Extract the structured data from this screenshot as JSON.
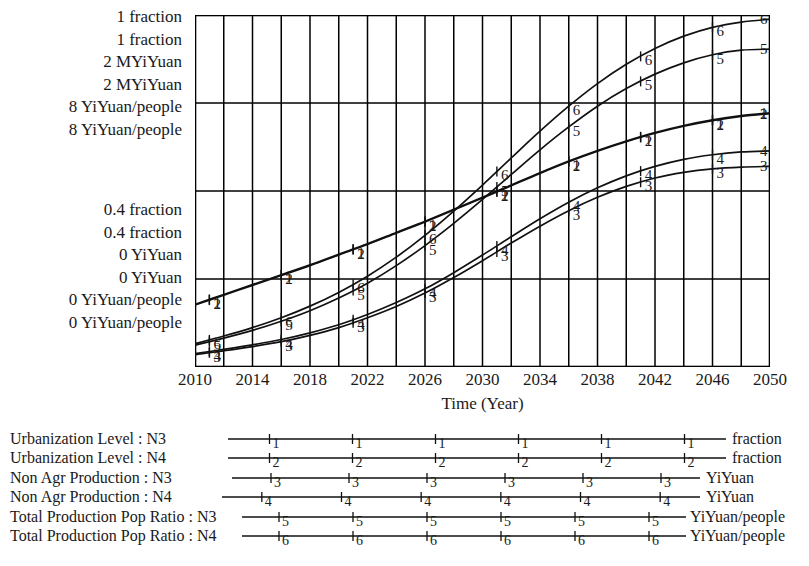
{
  "chart_data": {
    "type": "line",
    "title": "",
    "xlabel": "Time (Year)",
    "ylabel": "",
    "grid": true,
    "legend_position": "bottom",
    "x": [
      2010,
      2012,
      2014,
      2016,
      2018,
      2020,
      2022,
      2024,
      2026,
      2028,
      2030,
      2032,
      2034,
      2036,
      2038,
      2040,
      2042,
      2044,
      2046,
      2048,
      2050
    ],
    "xlim": [
      2010,
      2050
    ],
    "x_tick_labels": [
      "2010",
      "2014",
      "2018",
      "2022",
      "2026",
      "2030",
      "2034",
      "2038",
      "2042",
      "2046",
      "2050"
    ],
    "x_major_step": 4,
    "x_minor_step": 2,
    "axis_scales": [
      {
        "id": "scale-1",
        "marker": "1",
        "top_label": "1 fraction",
        "bottom_label": "0.4 fraction",
        "unit": "fraction",
        "max": "1",
        "min": "0.4"
      },
      {
        "id": "scale-2",
        "marker": "2",
        "top_label": "1 fraction",
        "bottom_label": "0.4 fraction",
        "unit": "fraction",
        "max": "1",
        "min": "0.4"
      },
      {
        "id": "scale-3",
        "marker": "3",
        "top_label": "2 MYiYuan",
        "bottom_label": "0 YiYuan",
        "unit": "YiYuan",
        "max": "2",
        "min": "0"
      },
      {
        "id": "scale-4",
        "marker": "4",
        "top_label": "2 MYiYuan",
        "bottom_label": "0 YiYuan",
        "unit": "YiYuan",
        "max": "2",
        "min": "0"
      },
      {
        "id": "scale-5",
        "marker": "5",
        "top_label": "8 YiYuan/people",
        "bottom_label": "0 YiYuan/people",
        "unit": "YiYuan/people",
        "max": "8",
        "min": "0"
      },
      {
        "id": "scale-6",
        "marker": "6",
        "top_label": "8 YiYuan/people",
        "bottom_label": "0 YiYuan/people",
        "unit": "YiYuan/people",
        "max": "8",
        "min": "0"
      }
    ],
    "y_gridlines_fraction": [
      1.0,
      0.75,
      0.5,
      0.25,
      0.0
    ],
    "series": [
      {
        "name": "Urbanization Level : N3",
        "marker": "1",
        "unit": "fraction",
        "values": [
          0.178,
          0.206,
          0.234,
          0.262,
          0.29,
          0.32,
          0.35,
          0.382,
          0.414,
          0.448,
          0.482,
          0.517,
          0.552,
          0.585,
          0.615,
          0.642,
          0.666,
          0.686,
          0.702,
          0.714,
          0.722
        ]
      },
      {
        "name": "Urbanization Level : N4",
        "marker": "2",
        "unit": "fraction",
        "values": [
          0.176,
          0.204,
          0.232,
          0.26,
          0.288,
          0.318,
          0.348,
          0.38,
          0.412,
          0.446,
          0.48,
          0.515,
          0.55,
          0.583,
          0.613,
          0.64,
          0.664,
          0.684,
          0.7,
          0.712,
          0.72
        ]
      },
      {
        "name": "Non Agr Production : N3",
        "marker": "3",
        "unit": "YiYuan",
        "values": [
          0.035,
          0.046,
          0.058,
          0.072,
          0.09,
          0.112,
          0.14,
          0.172,
          0.21,
          0.254,
          0.302,
          0.352,
          0.4,
          0.444,
          0.482,
          0.513,
          0.537,
          0.553,
          0.563,
          0.568,
          0.57
        ]
      },
      {
        "name": "Non Agr Production : N4",
        "marker": "4",
        "unit": "YiYuan",
        "values": [
          0.038,
          0.05,
          0.063,
          0.078,
          0.097,
          0.12,
          0.149,
          0.183,
          0.222,
          0.268,
          0.318,
          0.37,
          0.421,
          0.468,
          0.509,
          0.543,
          0.57,
          0.59,
          0.603,
          0.611,
          0.614
        ]
      },
      {
        "name": "Total Production Pop Ratio : N3",
        "marker": "5",
        "unit": "YiYuan/people",
        "values": [
          0.062,
          0.082,
          0.104,
          0.13,
          0.16,
          0.196,
          0.238,
          0.288,
          0.345,
          0.408,
          0.476,
          0.547,
          0.617,
          0.682,
          0.741,
          0.791,
          0.832,
          0.864,
          0.887,
          0.9,
          0.903
        ]
      },
      {
        "name": "Total Production Pop Ratio : N4",
        "marker": "6",
        "unit": "YiYuan/people",
        "values": [
          0.066,
          0.088,
          0.112,
          0.14,
          0.173,
          0.212,
          0.258,
          0.312,
          0.374,
          0.443,
          0.517,
          0.594,
          0.67,
          0.741,
          0.805,
          0.86,
          0.905,
          0.94,
          0.965,
          0.98,
          0.988
        ]
      }
    ],
    "marker_x_positions": [
      2011,
      2016,
      2021,
      2026,
      2031,
      2036,
      2041,
      2046
    ]
  },
  "legend": {
    "rows": [
      {
        "label": "Urbanization Level : N3",
        "marker": "1",
        "unit": "fraction"
      },
      {
        "label": "Urbanization Level : N4",
        "marker": "2",
        "unit": "fraction"
      },
      {
        "label": "Non Agr Production : N3",
        "marker": "3",
        "unit": "YiYuan"
      },
      {
        "label": "Non Agr Production : N4",
        "marker": "4",
        "unit": "YiYuan"
      },
      {
        "label": "Total Production Pop Ratio : N3",
        "marker": "5",
        "unit": "YiYuan/people"
      },
      {
        "label": "Total Production Pop Ratio : N4",
        "marker": "6",
        "unit": "YiYuan/people"
      }
    ]
  },
  "colors": {
    "line": "#111111",
    "grid": "#000000",
    "background": "#ffffff",
    "text": "#1a1a1a"
  }
}
